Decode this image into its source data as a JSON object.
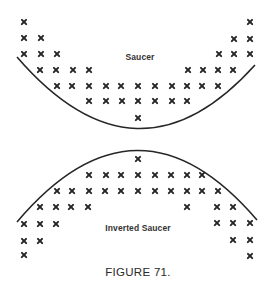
{
  "figure": {
    "caption": "FIGURE 71.",
    "stroke_color": "#262626"
  },
  "saucer": {
    "label": "Saucer",
    "label_pos": [
      140,
      57
    ],
    "arc": {
      "start": [
        17,
        57
      ],
      "control": [
        137,
        196
      ],
      "end": [
        255,
        65
      ]
    },
    "marks": [
      [
        24,
        22
      ],
      [
        250,
        22
      ],
      [
        24,
        38
      ],
      [
        41,
        38
      ],
      [
        234,
        39
      ],
      [
        250,
        39
      ],
      [
        24,
        54
      ],
      [
        41,
        54
      ],
      [
        57,
        54
      ],
      [
        219,
        54
      ],
      [
        234,
        54
      ],
      [
        250,
        54
      ],
      [
        40,
        70
      ],
      [
        56,
        70
      ],
      [
        73,
        70
      ],
      [
        89,
        70
      ],
      [
        188,
        70
      ],
      [
        203,
        70
      ],
      [
        218,
        70
      ],
      [
        233,
        70
      ],
      [
        57,
        86
      ],
      [
        72,
        86
      ],
      [
        89,
        86
      ],
      [
        106,
        86
      ],
      [
        121,
        86
      ],
      [
        138,
        86
      ],
      [
        155,
        86
      ],
      [
        172,
        86
      ],
      [
        187,
        86
      ],
      [
        202,
        86
      ],
      [
        218,
        86
      ],
      [
        89,
        101
      ],
      [
        106,
        101
      ],
      [
        122,
        101
      ],
      [
        138,
        101
      ],
      [
        155,
        101
      ],
      [
        172,
        101
      ],
      [
        187,
        101
      ],
      [
        138,
        118
      ]
    ]
  },
  "inverted_saucer": {
    "label": "Inverted Saucer",
    "label_pos": [
      138,
      228
    ],
    "arc": {
      "start": [
        17,
        222
      ],
      "control": [
        137,
        80
      ],
      "end": [
        257,
        220
      ]
    },
    "marks": [
      [
        138,
        159
      ],
      [
        89,
        175
      ],
      [
        106,
        175
      ],
      [
        121,
        175
      ],
      [
        138,
        175
      ],
      [
        155,
        175
      ],
      [
        171,
        175
      ],
      [
        187,
        175
      ],
      [
        202,
        175
      ],
      [
        57,
        191
      ],
      [
        72,
        191
      ],
      [
        89,
        191
      ],
      [
        105,
        191
      ],
      [
        121,
        191
      ],
      [
        138,
        191
      ],
      [
        155,
        191
      ],
      [
        171,
        191
      ],
      [
        187,
        191
      ],
      [
        202,
        191
      ],
      [
        218,
        191
      ],
      [
        40,
        207
      ],
      [
        56,
        207
      ],
      [
        71,
        207
      ],
      [
        88,
        207
      ],
      [
        187,
        207
      ],
      [
        217,
        207
      ],
      [
        233,
        207
      ],
      [
        24,
        224
      ],
      [
        40,
        224
      ],
      [
        56,
        224
      ],
      [
        217,
        223
      ],
      [
        233,
        223
      ],
      [
        250,
        223
      ],
      [
        24,
        241
      ],
      [
        40,
        241
      ],
      [
        233,
        240
      ],
      [
        250,
        240
      ],
      [
        24,
        255
      ],
      [
        250,
        256
      ]
    ]
  },
  "caption_pos": [
    138,
    272
  ]
}
